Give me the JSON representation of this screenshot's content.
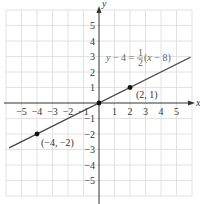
{
  "chart_data": {
    "type": "line",
    "title": "",
    "xlabel": "x",
    "ylabel": "y",
    "xlim": [
      -6,
      6
    ],
    "ylim": [
      -6,
      6
    ],
    "grid": true,
    "x_ticks": [
      -5,
      -4,
      -3,
      -2,
      -1,
      1,
      2,
      3,
      4,
      5
    ],
    "y_ticks": [
      5,
      4,
      3,
      2,
      1,
      -1,
      -2,
      -3,
      -4,
      -5
    ],
    "x_tick_labels": [
      "−5",
      "−4",
      "−3",
      "−2",
      "−1",
      "1",
      "2",
      "3",
      "4",
      "5"
    ],
    "y_tick_labels": [
      "5",
      "4",
      "3",
      "2",
      "1",
      "−1",
      "−2",
      "−3",
      "−4",
      "−5"
    ],
    "series": [
      {
        "name": "y − 4 = ½(x − 8)",
        "equation": "y = x/2",
        "x": [
          -5.8,
          5.9
        ],
        "y": [
          -2.9,
          2.95
        ]
      }
    ],
    "points": [
      {
        "x": -4,
        "y": -2,
        "label": "(−4, −2)"
      },
      {
        "x": 0,
        "y": 0,
        "label": ""
      },
      {
        "x": 2,
        "y": 1,
        "label": "(2, 1)"
      }
    ],
    "annotations": [
      {
        "text": "y − 4 = 1/2 (x − 8)",
        "position": "upper right"
      }
    ]
  },
  "labels": {
    "x_axis": "x",
    "y_axis": "y",
    "eq_left": "y − 4 = ",
    "eq_num": "1",
    "eq_den": "2",
    "eq_right": "(x − 8)",
    "pt1": "(2, 1)",
    "pt2": "(−4, −2)"
  },
  "colors": {
    "grid": "#e2e2e2",
    "axis": "#333333",
    "line": "#444444",
    "point": "#111111",
    "equation": "#666666"
  }
}
